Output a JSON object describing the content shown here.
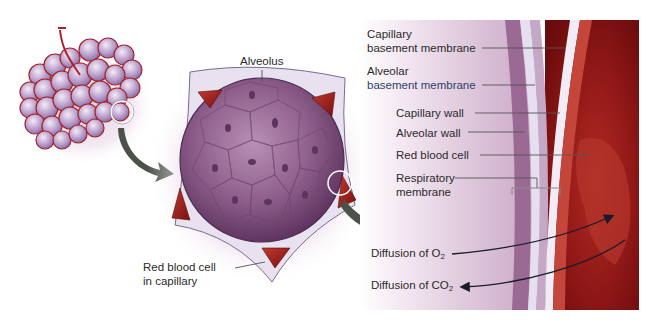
{
  "diagram": {
    "panels": [
      "lung-lobule-cluster",
      "alveolus-cross-section",
      "respiratory-membrane-closeup"
    ]
  },
  "labels": {
    "alveolus": "Alveolus",
    "rbc_capillary_line1": "Red blood cell",
    "rbc_capillary_line2": "in capillary",
    "capillary_basement_line1": "Capillary",
    "capillary_basement_line2": "basement membrane",
    "alveolar_basement_line1": "Alveolar",
    "alveolar_basement_line2": "basement membrane",
    "capillary_wall": "Capillary wall",
    "alveolar_wall": "Alveolar wall",
    "red_blood_cell": "Red blood cell",
    "respiratory_line1": "Respiratory",
    "respiratory_line2": "membrane",
    "diffusion_o2_prefix": "Diffusion of O",
    "diffusion_o2_sub": "2",
    "diffusion_co2_prefix": "Diffusion of CO",
    "diffusion_co2_sub": "2"
  },
  "colors": {
    "alveolus_purple": "#8a5a86",
    "capillary_red": "#8e1a1a",
    "blood_dark": "#7a0f10",
    "arrow_gray": "#4a524a",
    "membrane_light": "#e6dff0",
    "leader_line": "#555555"
  }
}
